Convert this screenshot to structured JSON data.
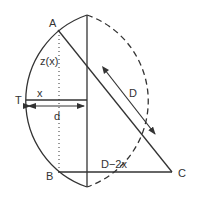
{
  "diagram": {
    "labels": {
      "A": "A",
      "B": "B",
      "C": "C",
      "T": "T",
      "z": "z(x)",
      "x": "x",
      "d": "d",
      "D": "D",
      "D2x": "D−2x"
    },
    "colors": {
      "stroke": "#333333",
      "background": "#ffffff"
    }
  }
}
